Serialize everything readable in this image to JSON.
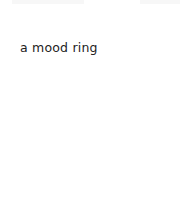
{
  "page": {
    "background": "#ffffff",
    "title": "a mood ring",
    "title_color": "#222222"
  }
}
